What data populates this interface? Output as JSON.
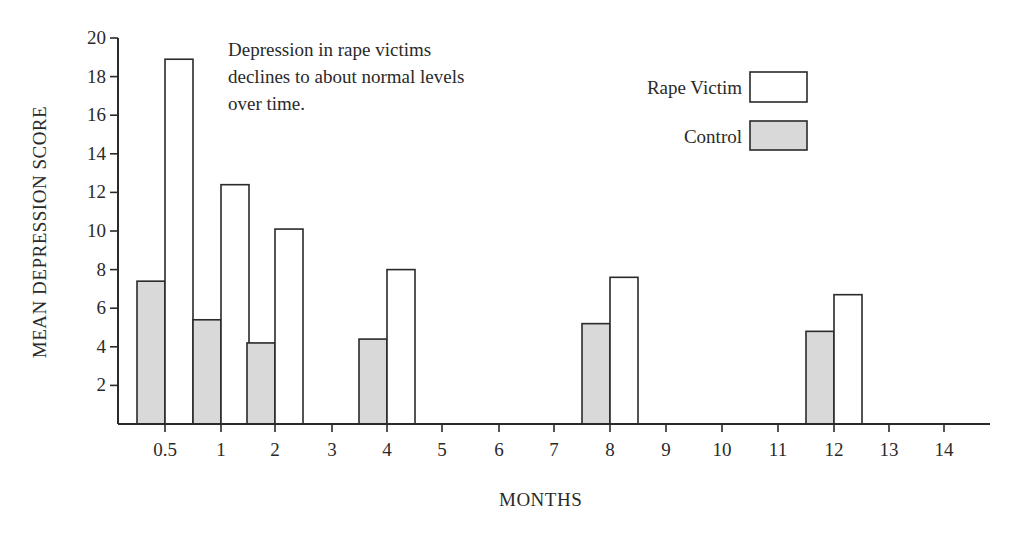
{
  "chart_data": {
    "type": "bar",
    "title": "",
    "annotation": "Depression in rape victims\ndeclines to about normal levels\nover time.",
    "xlabel": "MONTHS",
    "ylabel": "MEAN DEPRESSION SCORE",
    "ylim": [
      0,
      20
    ],
    "yticks": [
      2,
      4,
      6,
      8,
      10,
      12,
      14,
      16,
      18,
      20
    ],
    "xticks": [
      "0.5",
      "1",
      "2",
      "3",
      "4",
      "5",
      "6",
      "7",
      "8",
      "9",
      "10",
      "11",
      "12",
      "13",
      "14"
    ],
    "categories": [
      "0.5",
      "1",
      "2",
      "4",
      "8",
      "12"
    ],
    "series": [
      {
        "name": "Rape Victim",
        "color": "#ffffff",
        "values": [
          18.9,
          12.4,
          10.1,
          8.0,
          7.6,
          6.7
        ]
      },
      {
        "name": "Control",
        "color": "#d9d9d9",
        "values": [
          7.4,
          5.4,
          4.2,
          4.4,
          5.2,
          4.8
        ]
      }
    ],
    "grid": false,
    "legend_position": "upper right"
  },
  "legend": {
    "items": [
      {
        "label": "Rape Victim",
        "color": "#ffffff"
      },
      {
        "label": "Control",
        "color": "#d9d9d9"
      }
    ]
  }
}
